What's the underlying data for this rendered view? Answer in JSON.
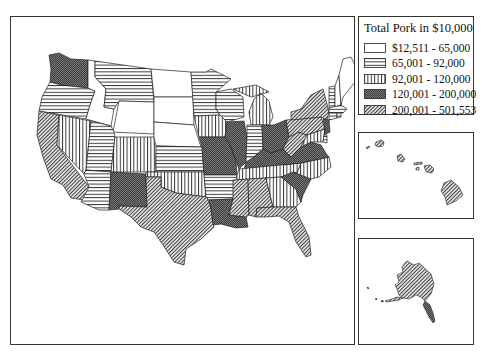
{
  "legend": {
    "title": "Total Pork in $10,000",
    "classes": [
      {
        "label": "$12,511 - 65,000",
        "pattern": "blank"
      },
      {
        "label": "65,001 - 92,000",
        "pattern": "horizontal-lines"
      },
      {
        "label": "92,001 - 120,000",
        "pattern": "vertical-lines"
      },
      {
        "label": "120,001 - 200,000",
        "pattern": "dense-crosshatch"
      },
      {
        "label": "200,001 - 501,553",
        "pattern": "diagonal-lines"
      }
    ]
  },
  "colors": {
    "stroke": "#222222",
    "dense_fill": "#4a4a4a",
    "background": "#ffffff"
  },
  "states": {
    "WA": "dense",
    "OR": "horizontal",
    "CA": "diagonal",
    "ID": "blank",
    "NV": "vertical",
    "MT": "horizontal",
    "WY": "blank",
    "UT": "horizontal",
    "AZ": "horizontal",
    "CO": "vertical",
    "NM": "dense",
    "ND": "blank",
    "SD": "blank",
    "NE": "blank",
    "KS": "horizontal",
    "OK": "vertical",
    "TX": "diagonal",
    "MN": "horizontal",
    "IA": "vertical",
    "MO": "dense",
    "AR": "horizontal",
    "LA": "dense",
    "WI": "horizontal",
    "IL": "dense",
    "MI": "vertical",
    "IN": "horizontal",
    "OH": "dense",
    "KY": "dense",
    "TN": "vertical",
    "MS": "diagonal",
    "AL": "diagonal",
    "GA": "vertical",
    "FL": "diagonal",
    "SC": "dense",
    "NC": "vertical",
    "VA": "dense",
    "WV": "diagonal",
    "PA": "diagonal",
    "NY": "diagonal",
    "NJ": "dense",
    "MD": "vertical",
    "DE": "horizontal",
    "VT": "horizontal",
    "NH": "blank",
    "ME": "blank",
    "MA": "horizontal",
    "CT": "horizontal",
    "RI": "horizontal",
    "HI": "diagonal",
    "AK": "diagonal"
  }
}
